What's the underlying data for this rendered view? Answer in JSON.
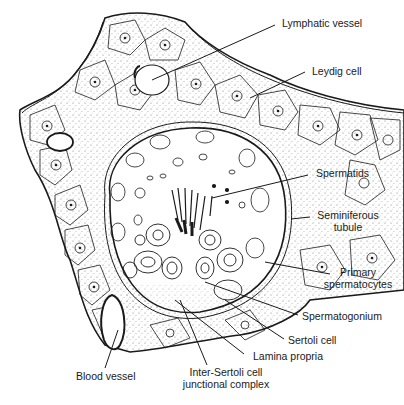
{
  "diagram": {
    "type": "anatomical-illustration",
    "labels": {
      "lymphatic_vessel": "Lymphatic vessel",
      "leydig_cell": "Leydig cell",
      "spermatids": "Spermatids",
      "seminiferous_tubule_1": "Seminiferous",
      "seminiferous_tubule_2": "tubule",
      "primary_spermatocytes_1": "Primary",
      "primary_spermatocytes_2": "spermatocytes",
      "spermatogonium": "Spermatogonium",
      "sertoli_cell": "Sertoli cell",
      "lamina_propria": "Lamina propria",
      "inter_sertoli_1": "Inter-Sertoli cell",
      "inter_sertoli_2": "junctional complex",
      "blood_vessel": "Blood vessel"
    },
    "colors": {
      "ink": "#1a1a1a",
      "background": "#ffffff",
      "stipple": "#555555"
    }
  }
}
